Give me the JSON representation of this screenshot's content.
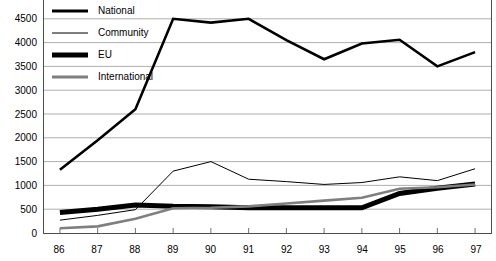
{
  "chart_data": {
    "type": "line",
    "title": "",
    "subtitle": "",
    "xlabel": "",
    "ylabel": "",
    "xlim": [
      86,
      97
    ],
    "ylim": [
      0,
      5000
    ],
    "grid": true,
    "legend_position": "top-left-inside",
    "x": [
      "86",
      "87",
      "88",
      "89",
      "90",
      "91",
      "92",
      "93",
      "94",
      "95",
      "96",
      "97"
    ],
    "categories": [
      "86",
      "87",
      "88",
      "89",
      "90",
      "91",
      "92",
      "93",
      "94",
      "95",
      "96",
      "97"
    ],
    "y_ticks": [
      "0",
      "500",
      "1000",
      "1500",
      "2000",
      "2500",
      "3000",
      "3500",
      "4000",
      "4500",
      "5000"
    ],
    "y_tick_values": [
      0,
      500,
      1000,
      1500,
      2000,
      2500,
      3000,
      3500,
      4000,
      4500,
      5000
    ],
    "series": [
      {
        "name": "National",
        "color": "#000000",
        "width": 2.6,
        "values": [
          1330,
          1950,
          2600,
          4500,
          4420,
          4500,
          4050,
          3650,
          3980,
          4060,
          3500,
          3800
        ]
      },
      {
        "name": "Community",
        "color": "#000000",
        "width": 1.0,
        "values": [
          270,
          370,
          490,
          1300,
          1500,
          1130,
          1080,
          1020,
          1060,
          1180,
          1100,
          1350
        ]
      },
      {
        "name": "EU",
        "color": "#000000",
        "width": 5.0,
        "values": [
          430,
          500,
          590,
          560,
          550,
          530,
          530,
          530,
          530,
          830,
          940,
          1030
        ]
      },
      {
        "name": "International",
        "color": "#7f7f7f",
        "width": 2.6,
        "values": [
          100,
          140,
          300,
          520,
          530,
          560,
          620,
          680,
          740,
          930,
          960,
          1020
        ]
      }
    ]
  },
  "axis": {
    "y_top_label_clipped": "5000"
  }
}
